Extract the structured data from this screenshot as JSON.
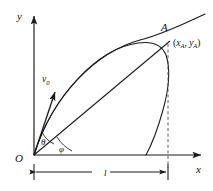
{
  "figure": {
    "type": "physics-diagram",
    "background_color": "#ffffff",
    "stroke_color": "#1a1a1a"
  },
  "axes": {
    "y_label": "y",
    "x_label": "x",
    "origin_label": "O"
  },
  "labels": {
    "velocity": "v",
    "velocity_sub": "0",
    "angle_theta": "θ",
    "angle_phi": "φ",
    "point_a": "A",
    "coord_open": "(",
    "coord_x": "x",
    "coord_x_sub": "A",
    "coord_comma": ", ",
    "coord_y": "y",
    "coord_y_sub": "A",
    "coord_close": ")",
    "range": "l"
  },
  "caption": {
    "text": ""
  },
  "geometry": {
    "origin": [
      34,
      155
    ],
    "point_a": [
      168,
      40
    ],
    "y_axis_top": [
      34,
      12
    ],
    "x_axis_right": [
      205,
      155
    ],
    "dimension_line_y": 172,
    "dimension_from_x": 34,
    "dimension_to_x": 168,
    "theta_deg": 62,
    "phi_deg": 41
  }
}
